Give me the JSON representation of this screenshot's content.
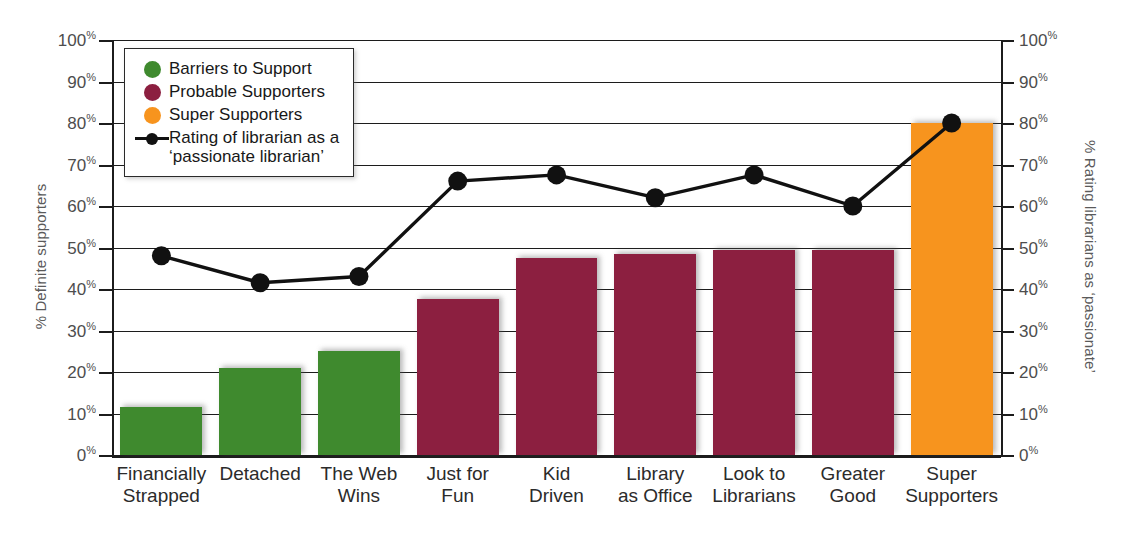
{
  "chart_data": {
    "type": "bar",
    "title": "",
    "categories": [
      "Financially\nStrapped",
      "Detached",
      "The Web\nWins",
      "Just for\nFun",
      "Kid\nDriven",
      "Library\nas Office",
      "Look to\nLibrarians",
      "Greater\nGood",
      "Super\nSupporters"
    ],
    "series": [
      {
        "name": "Barriers to Support",
        "type": "bar",
        "color": "#3f8a2e",
        "axis": "left",
        "values": [
          11.5,
          21,
          25,
          null,
          null,
          null,
          null,
          null,
          null
        ]
      },
      {
        "name": "Probable Supporters",
        "type": "bar",
        "color": "#8c1f40",
        "axis": "left",
        "values": [
          null,
          null,
          null,
          37.5,
          47.5,
          48.5,
          49.5,
          49.5,
          null
        ]
      },
      {
        "name": "Super Supporters",
        "type": "bar",
        "color": "#f7941e",
        "axis": "left",
        "values": [
          null,
          null,
          null,
          null,
          null,
          null,
          null,
          null,
          80
        ]
      },
      {
        "name": "Rating of librarian as a 'passionate librarian'",
        "type": "line",
        "color": "#111111",
        "axis": "right",
        "values": [
          48,
          41.5,
          43,
          66,
          67.5,
          62,
          67.5,
          60,
          80
        ]
      }
    ],
    "ylabel": "% Definite supporters",
    "y2label": "% Rating librarians as ‘passionate’",
    "xlabel": "",
    "ylim": [
      0,
      100
    ],
    "y2lim": [
      0,
      100
    ],
    "yticks": [
      "0%",
      "10%",
      "20%",
      "30%",
      "40%",
      "50%",
      "60%",
      "70%",
      "80%",
      "90%",
      "100%"
    ],
    "y2ticks": [
      "0%",
      "10%",
      "20%",
      "30%",
      "40%",
      "50%",
      "60%",
      "70%",
      "80%",
      "90%",
      "100%"
    ],
    "grid": true,
    "legend_position": "upper-left"
  },
  "axes": {
    "left_title": "% Definite supporters",
    "right_title": "% Rating librarians as ‘passionate’",
    "tick_values": [
      100,
      90,
      80,
      70,
      60,
      50,
      40,
      30,
      20,
      10,
      0
    ],
    "tick_suffix": "%"
  },
  "legend": {
    "items": [
      {
        "label": "Barriers to Support",
        "color": "#3f8a2e",
        "marker": "circle-swatch"
      },
      {
        "label": "Probable Supporters",
        "color": "#8c1f40",
        "marker": "circle-swatch"
      },
      {
        "label": "Super Supporters",
        "color": "#f7941e",
        "marker": "circle-swatch"
      },
      {
        "label": "Rating of librarian as a\n‘passionate librarian’",
        "color": "#111111",
        "marker": "line-marker"
      }
    ]
  },
  "colors": {
    "green": "#3f8a2e",
    "maroon": "#8c1f40",
    "orange": "#f7941e",
    "line": "#111111",
    "axis": "#1c1c1c",
    "tick_text": "#4d4d4d",
    "background": "#ffffff"
  }
}
